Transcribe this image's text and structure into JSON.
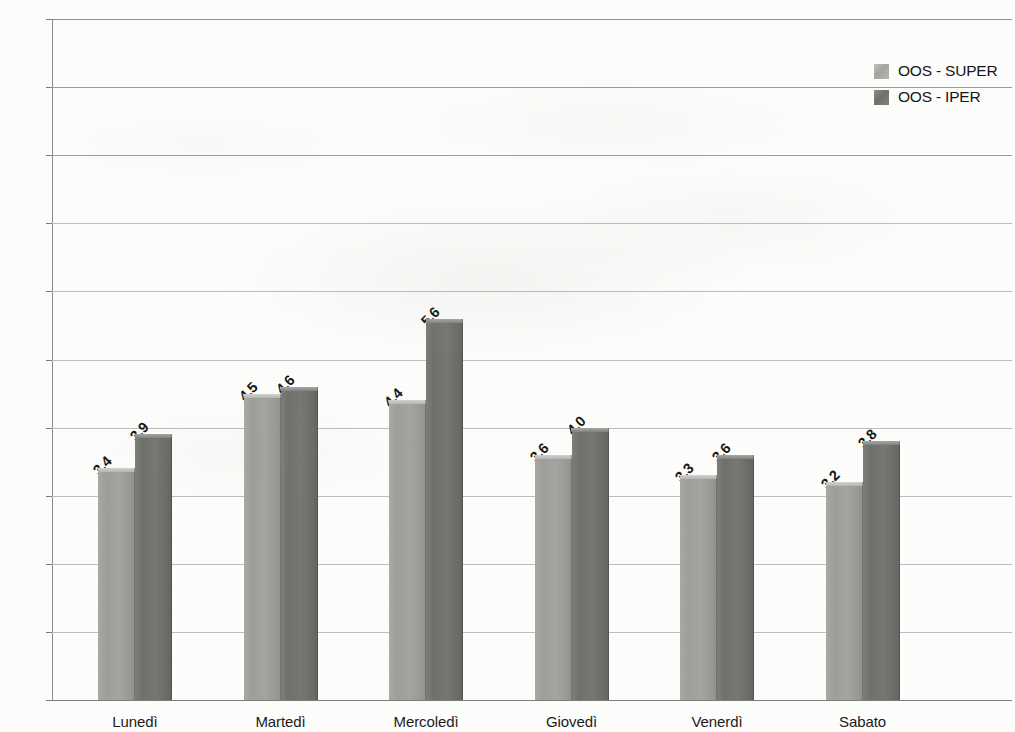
{
  "chart_data": {
    "type": "bar",
    "title": "",
    "xlabel": "",
    "ylabel": "",
    "ylim": [
      0,
      10
    ],
    "grid": true,
    "legend_position": "top-right",
    "value_label_format": "comma-decimal",
    "categories": [
      "Lunedì",
      "Martedì",
      "Mercoledì",
      "Giovedì",
      "Venerdì",
      "Sabato"
    ],
    "ytick_labels": [
      "0%",
      "1%",
      "2%",
      "3%",
      "4%",
      "5%",
      "6%",
      "7%",
      "8%",
      "9%",
      "10%"
    ],
    "ytick_values": [
      0,
      1,
      2,
      3,
      4,
      5,
      6,
      7,
      8,
      9,
      10
    ],
    "series": [
      {
        "name": "OOS - SUPER",
        "color": "#a4a4a1",
        "values": [
          3.4,
          4.5,
          4.4,
          3.6,
          3.3,
          3.2
        ],
        "labels": [
          "3,4",
          "4,5",
          "4,4",
          "3,6",
          "3,3",
          "3,2"
        ]
      },
      {
        "name": "OOS - IPER",
        "color": "#727270",
        "values": [
          3.9,
          4.6,
          5.6,
          4.0,
          3.6,
          3.8
        ],
        "labels": [
          "3,9",
          "4,6",
          "5,6",
          "4,0",
          "3,6",
          "3,8"
        ]
      }
    ]
  },
  "legend": {
    "items": [
      {
        "label": "OOS - SUPER",
        "swatch": "super"
      },
      {
        "label": "OOS - IPER",
        "swatch": "iper"
      }
    ]
  }
}
